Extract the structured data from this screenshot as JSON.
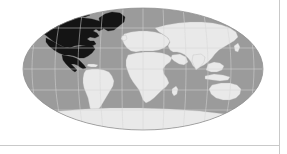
{
  "figure": {
    "projection": "robinson",
    "background_color": "#ffffff",
    "caption": ""
  },
  "map": {
    "name": "world-locator-map",
    "ocean_color": "#9b9b9b",
    "land_color": "#e9e9e9",
    "land_outline_color": "#b4b4b4",
    "highlight_color": "#141414",
    "graticule_color": "#d6d6d6",
    "outline_color": "#8a8a8a",
    "highlighted_regions": [
      "United States",
      "Canada",
      "Mexico",
      "Greenland"
    ],
    "ellipse": {
      "center_x": 143,
      "center_y": 69,
      "radius_x": 120,
      "radius_y": 61
    },
    "graticule": {
      "meridian_step_degrees": 30,
      "parallel_step_degrees": 30,
      "longitude_lines": [
        -180,
        -150,
        -120,
        -90,
        -60,
        -30,
        0,
        30,
        60,
        90,
        120,
        150,
        180
      ],
      "latitude_lines": [
        -60,
        -30,
        0,
        30,
        60
      ]
    }
  },
  "chrome": {
    "bottom_divider_color": "#c9c9c9",
    "right_divider_color": "#c9c9c9"
  }
}
